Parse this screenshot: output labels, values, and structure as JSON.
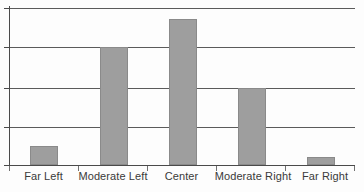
{
  "chart_data": {
    "type": "bar",
    "title": "",
    "subtitle": "",
    "xlabel": "",
    "ylabel": "",
    "categories": [
      "Far Left",
      "Moderate Left",
      "Center",
      "Moderate Right",
      "Far Right"
    ],
    "values": [
      12,
      75,
      93,
      49,
      5
    ],
    "ylim": [
      0,
      100
    ],
    "grid": true,
    "gridline_count": 5,
    "gridline_values": [
      0,
      25,
      50,
      75,
      100
    ],
    "legend": [],
    "legend_position": "none",
    "axis_tick_labels": [],
    "bar_color": "#9e9e9e",
    "bar_outline_color": "#8a8a8a",
    "axis_color": "#4a4a4a",
    "gridline_color": "#5b5b5b",
    "label_color": "#3a3a3a",
    "background_color": "#fdfdfd"
  },
  "axes": {
    "y_ticks": [
      {
        "name": "y-tick-100"
      },
      {
        "name": "y-tick-75"
      },
      {
        "name": "y-tick-50"
      },
      {
        "name": "y-tick-25"
      },
      {
        "name": "y-tick-0"
      }
    ],
    "x_ticks": [
      {
        "name": "x-tick-0"
      },
      {
        "name": "x-tick-1"
      },
      {
        "name": "x-tick-2"
      },
      {
        "name": "x-tick-3"
      },
      {
        "name": "x-tick-4"
      },
      {
        "name": "x-tick-5"
      }
    ]
  }
}
